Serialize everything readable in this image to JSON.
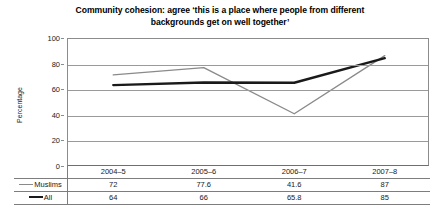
{
  "chart_data": {
    "type": "line",
    "title": "Community cohesion: agree ‘this is a place where people from different backgrounds get on well together’",
    "title_line1": "Community cohesion: agree ‘this is a place where people from different",
    "title_line2": "backgrounds get on well together’",
    "xlabel": "",
    "ylabel": "Percentage",
    "categories": [
      "2004–5",
      "2005–6",
      "2006–7",
      "2007–8"
    ],
    "ylim": [
      0,
      100
    ],
    "yticks": [
      0,
      20,
      40,
      60,
      80,
      100
    ],
    "ytick_labels": [
      "0",
      "20",
      "40",
      "60",
      "80",
      "100"
    ],
    "grid": true,
    "legend_position": "table-row-labels",
    "series": [
      {
        "name": "Muslims",
        "values": [
          72,
          77.6,
          41.6,
          87
        ],
        "value_labels": [
          "72",
          "77.6",
          "41.6",
          "87"
        ],
        "color": "#8a8a8a",
        "width": 1.4
      },
      {
        "name": "All",
        "values": [
          64,
          66,
          65.8,
          85
        ],
        "value_labels": [
          "64",
          "66",
          "65.8",
          "85"
        ],
        "color": "#1a1a1a",
        "width": 2.4
      }
    ]
  },
  "table": {
    "corner_label": "",
    "column_headers": [
      "2004–5",
      "2005–6",
      "2006–7",
      "2007–8"
    ],
    "rows": [
      {
        "label": "Muslims",
        "swatch": "thin",
        "values": [
          "72",
          "77.6",
          "41.6",
          "87"
        ]
      },
      {
        "label": "All",
        "swatch": "thick",
        "values": [
          "64",
          "66",
          "65.8",
          "85"
        ]
      }
    ]
  }
}
